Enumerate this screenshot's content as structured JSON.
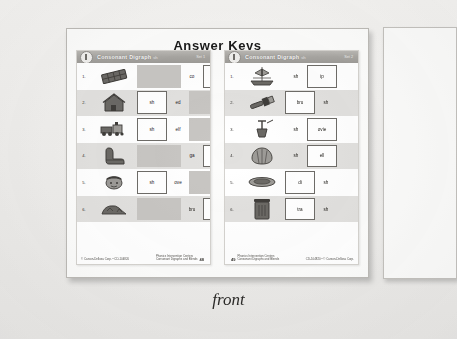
{
  "photo": {
    "heading": "Answer Keys",
    "caption": "front",
    "background_color": "#f2f1ef"
  },
  "worksheets": [
    {
      "id": "left-page",
      "header": {
        "badge": "1",
        "title": "Consonant Digraph",
        "subtitle": "sh",
        "set_label": "Set 1"
      },
      "footer": {
        "left": "© Carson-Dellosa Corp. • CD-104820",
        "right_line1": "Phonics Intervention Centers",
        "right_line2": "Consonant Digraphs and Blends",
        "page": "48"
      },
      "rows": [
        {
          "num": "1.",
          "picture": "chocolate-bar-icon",
          "cells": [
            {
              "type": "filled",
              "width": "wide",
              "text": ""
            },
            {
              "type": "open",
              "width": "narrow",
              "text": "co"
            },
            {
              "type": "boxed",
              "width": "mid",
              "text": "sh"
            }
          ]
        },
        {
          "num": "2.",
          "picture": "house-icon",
          "cells": [
            {
              "type": "boxed",
              "width": "mid",
              "text": "sh"
            },
            {
              "type": "open",
              "width": "narrow",
              "text": "ed"
            },
            {
              "type": "filled",
              "width": "wide",
              "text": ""
            }
          ]
        },
        {
          "num": "3.",
          "picture": "train-icon",
          "cells": [
            {
              "type": "boxed",
              "width": "mid",
              "text": "sh"
            },
            {
              "type": "open",
              "width": "narrow",
              "text": "elf"
            },
            {
              "type": "filled",
              "width": "wide",
              "text": ""
            }
          ]
        },
        {
          "num": "4.",
          "picture": "boot-icon",
          "cells": [
            {
              "type": "filled",
              "width": "wide",
              "text": ""
            },
            {
              "type": "open",
              "width": "narrow",
              "text": "ga"
            },
            {
              "type": "boxed",
              "width": "mid",
              "text": "sh"
            }
          ]
        },
        {
          "num": "5.",
          "picture": "boy-face-icon",
          "cells": [
            {
              "type": "boxed",
              "width": "mid",
              "text": "sh"
            },
            {
              "type": "open",
              "width": "narrow",
              "text": "ove"
            },
            {
              "type": "filled",
              "width": "wide",
              "text": ""
            }
          ]
        },
        {
          "num": "6.",
          "picture": "trash-pile-icon",
          "cells": [
            {
              "type": "filled",
              "width": "wide",
              "text": ""
            },
            {
              "type": "open",
              "width": "narrow",
              "text": "bru"
            },
            {
              "type": "boxed",
              "width": "mid",
              "text": "sh"
            }
          ]
        }
      ]
    },
    {
      "id": "right-page",
      "header": {
        "badge": "1",
        "title": "Consonant Digraph",
        "subtitle": "sh",
        "set_label": "Set 2"
      },
      "footer": {
        "left_line1": "Phonics Intervention Centers",
        "left_line2": "Consonant Digraphs and Blends",
        "right": "CD-104820 • © Carson-Dellosa Corp.",
        "page": "49"
      },
      "rows": [
        {
          "num": "1.",
          "picture": "ship-icon",
          "cells": [
            {
              "type": "open",
              "width": "narrow",
              "text": "sh"
            },
            {
              "type": "boxed",
              "width": "mid",
              "text": "ip"
            }
          ]
        },
        {
          "num": "2.",
          "picture": "brush-icon",
          "cells": [
            {
              "type": "boxed",
              "width": "mid",
              "text": "bru"
            },
            {
              "type": "open",
              "width": "narrow",
              "text": "sh"
            }
          ]
        },
        {
          "num": "3.",
          "picture": "shovel-icon",
          "cells": [
            {
              "type": "open",
              "width": "narrow",
              "text": "sh"
            },
            {
              "type": "boxed",
              "width": "mid",
              "text": "ovie"
            }
          ]
        },
        {
          "num": "4.",
          "picture": "shell-icon",
          "cells": [
            {
              "type": "open",
              "width": "narrow",
              "text": "sh"
            },
            {
              "type": "boxed",
              "width": "mid",
              "text": "ell"
            }
          ]
        },
        {
          "num": "5.",
          "picture": "dish-icon",
          "cells": [
            {
              "type": "boxed",
              "width": "mid",
              "text": "di"
            },
            {
              "type": "open",
              "width": "narrow",
              "text": "sh"
            }
          ]
        },
        {
          "num": "6.",
          "picture": "trash-can-icon",
          "cells": [
            {
              "type": "boxed",
              "width": "mid",
              "text": "tra"
            },
            {
              "type": "open",
              "width": "narrow",
              "text": "sh"
            }
          ]
        }
      ]
    }
  ],
  "side_panel": {
    "id": "partial-right-card",
    "label": ""
  }
}
